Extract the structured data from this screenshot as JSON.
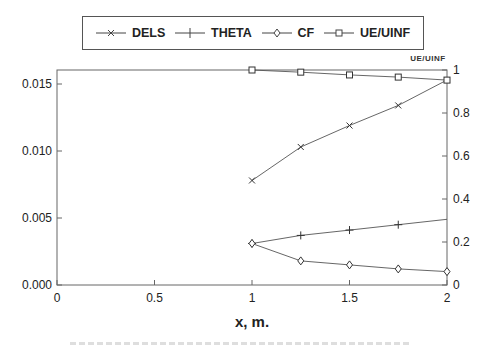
{
  "legend": {
    "items": [
      {
        "label": "DELS",
        "marker": "x-marker"
      },
      {
        "label": "THETA",
        "marker": "plus-marker"
      },
      {
        "label": "CF",
        "marker": "diamond-marker"
      },
      {
        "label": "UE/UINF",
        "marker": "square-marker"
      }
    ]
  },
  "axes": {
    "xlabel": "x, m.",
    "right_ylabel": "UE/UINF",
    "x_ticks": [
      "0",
      "0.5",
      "1",
      "1.5",
      "2"
    ],
    "left_ticks": [
      "0.000",
      "0.005",
      "0.010",
      "0.015"
    ],
    "right_ticks": [
      "0",
      "0.2",
      "0.4",
      "0.6",
      "0.8",
      "1"
    ]
  },
  "chart_data": {
    "type": "line",
    "title": "",
    "xlabel": "x, m.",
    "ylabel": "",
    "y2label": "UE/UINF",
    "xlim": [
      0,
      2
    ],
    "ylim": [
      0,
      0.016
    ],
    "y2lim": [
      0,
      1
    ],
    "grid": false,
    "legend_position": "top (outside, boxed)",
    "x": [
      1.0,
      1.25,
      1.5,
      1.75,
      2.0
    ],
    "x_ticks": [
      0,
      0.5,
      1,
      1.5,
      2
    ],
    "y_ticks": [
      0.0,
      0.005,
      0.01,
      0.015
    ],
    "y2_ticks": [
      0,
      0.2,
      0.4,
      0.6,
      0.8,
      1
    ],
    "series": [
      {
        "name": "DELS",
        "axis": "left",
        "marker": "x",
        "values": [
          0.0078,
          0.0103,
          0.0119,
          0.0134,
          0.0153
        ]
      },
      {
        "name": "THETA",
        "axis": "left",
        "marker": "+",
        "values": [
          0.0031,
          0.0037,
          0.0041,
          0.0045,
          0.0049
        ]
      },
      {
        "name": "CF",
        "axis": "left",
        "marker": "diamond",
        "values": [
          0.0031,
          0.0018,
          0.0015,
          0.0012,
          0.001
        ]
      },
      {
        "name": "UE/UINF",
        "axis": "right",
        "marker": "square",
        "values": [
          1.0,
          0.99,
          0.977,
          0.967,
          0.953
        ]
      }
    ]
  },
  "caption": {
    "text": ""
  }
}
